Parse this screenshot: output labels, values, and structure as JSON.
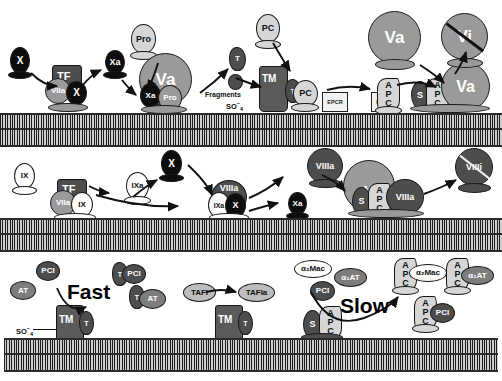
{
  "figure": {
    "rows": [
      {
        "name": "prothrombinase-and-protein-c-activation"
      },
      {
        "name": "intrinsic-tenase-and-apc-inactivation-of-fviiia"
      },
      {
        "name": "thrombin-and-apc-inhibition-by-serpins"
      }
    ]
  },
  "row1": {
    "factor_x_free": "X",
    "tf": "TF",
    "fviia": "VIIa",
    "factor_x_bound": "X",
    "factor_xa_free": "Xa",
    "prothrombin_free": "Pro",
    "factor_va": "Va",
    "factor_xa_bound": "Xa",
    "prothrombin_bound": "Pro",
    "thrombin": "T",
    "fragments": "Fragments",
    "sulfate": "SO",
    "sulfate_sup": "–",
    "sulfate_sub": "4",
    "protein_c_free": "PC",
    "thrombomodulin": "TM",
    "thrombin_on_tm": "T",
    "protein_c_bound": "PC",
    "epcr_left": "EPCR",
    "epcr_right": "EPCR",
    "apc_a": "A",
    "apc_p": "P",
    "apc_c": "C",
    "protein_s": "S",
    "factor_va_free": "Va",
    "factor_va_complex": "Va",
    "factor_vi": "Vi"
  },
  "row2": {
    "factor_ix_free": "IX",
    "tf": "TF",
    "fviia": "VIIa",
    "factor_ix_bound": "IX",
    "factor_ixa_free": "IXa",
    "factor_x_free": "X",
    "fviiia_complex": "VIIIa",
    "factor_ixa_bound": "IXa",
    "factor_x_bound": "X",
    "factor_xa": "Xa",
    "fviiia_free": "VIIIa",
    "factor_v": "V",
    "protein_s": "S",
    "apc_a": "A",
    "apc_p": "P",
    "apc_c": "C",
    "fviiia_bound": "VIIIa",
    "fviiii_inactivated": "VIIIi"
  },
  "row3": {
    "pci_free": "PCI",
    "at_free": "AT",
    "fast_label": "Fast",
    "thrombomodulin_1": "TM",
    "thrombin_1": "T",
    "sulfate": "SO",
    "sulfate_sup": "–",
    "sulfate_sub": "4",
    "thrombin_pci_t": "T",
    "thrombin_pci": "PCI",
    "thrombin_at_t": "T",
    "thrombin_at": "AT",
    "tafi": "TAFI",
    "thrombomodulin_2": "TM",
    "thrombin_2": "T",
    "tafia": "TAFIa",
    "a2mac_free": "α₂Mac",
    "a1at_free": "α₁AT",
    "pci_free_2": "PCI",
    "slow_label": "Slow",
    "protein_s": "S",
    "apc_a": "A",
    "apc_p": "P",
    "apc_c": "C",
    "apc_a2mac_a": "A",
    "apc_a2mac_p": "P",
    "apc_a2mac_c": "C",
    "apc_a2mac": "α₂Mac",
    "apc_a1at_a": "A",
    "apc_a1at_p": "P",
    "apc_a1at_c": "C",
    "apc_a1at": "α₁AT",
    "apc_pci_a": "A",
    "apc_pci_p": "P",
    "apc_pci_c": "C",
    "apc_pci": "PCI"
  },
  "colors": {
    "black": "#0d0d0d",
    "dark_grey": "#4d4d4d",
    "mid_grey": "#7d7d7d",
    "grey": "#9a9a9a",
    "light_grey": "#bdbdbd",
    "pale_grey": "#d6d6d6",
    "white": "#fdfdfd",
    "membrane": "#b9b9b9",
    "outline": "#141414"
  }
}
